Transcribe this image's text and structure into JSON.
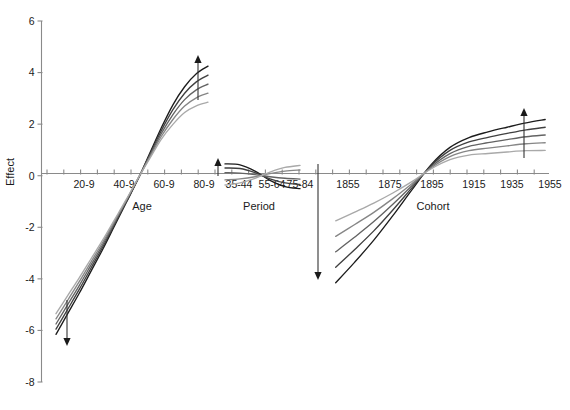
{
  "chart_data": {
    "type": "line",
    "title": "",
    "xlabel": "",
    "ylabel": "Effect",
    "ylim": [
      -8,
      6
    ],
    "grid": false,
    "legend": "none",
    "y_ticks": [
      "6",
      "4",
      "2",
      "0",
      "-2",
      "-4",
      "-6",
      "-8"
    ],
    "y_tick_values": [
      6,
      4,
      2,
      0,
      -2,
      -4,
      -6,
      -8
    ],
    "panels": [
      {
        "name": "Age",
        "label": "Age",
        "tick_labels": [
          "20-9",
          "40-9",
          "60-9",
          "80-9"
        ],
        "x": [
          20,
          25,
          30,
          35,
          40,
          45,
          50,
          55,
          60,
          65,
          70,
          75,
          80,
          85
        ],
        "series": [
          {
            "name": "curve-1",
            "color": "#1c1c1c",
            "values": [
              -6.15,
              -5.35,
              -4.55,
              -3.7,
              -2.85,
              -1.95,
              -1.05,
              -0.15,
              0.85,
              1.85,
              2.75,
              3.45,
              3.95,
              4.25
            ]
          },
          {
            "name": "curve-2",
            "color": "#404040",
            "values": [
              -5.95,
              -5.18,
              -4.4,
              -3.58,
              -2.76,
              -1.89,
              -1.02,
              -0.14,
              0.8,
              1.74,
              2.56,
              3.2,
              3.64,
              3.9
            ]
          },
          {
            "name": "curve-3",
            "color": "#636363",
            "values": [
              -5.75,
              -5.0,
              -4.25,
              -3.46,
              -2.67,
              -1.83,
              -0.99,
              -0.13,
              0.75,
              1.63,
              2.37,
              2.95,
              3.33,
              3.55
            ]
          },
          {
            "name": "curve-4",
            "color": "#868686",
            "values": [
              -5.55,
              -4.83,
              -4.1,
              -3.34,
              -2.58,
              -1.77,
              -0.96,
              -0.12,
              0.7,
              1.52,
              2.18,
              2.7,
              3.02,
              3.2
            ]
          },
          {
            "name": "curve-5",
            "color": "#a9a9a9",
            "values": [
              -5.35,
              -4.65,
              -3.95,
              -3.22,
              -2.49,
              -1.71,
              -0.93,
              -0.11,
              0.65,
              1.41,
              1.99,
              2.45,
              2.71,
              2.85
            ]
          }
        ],
        "arrows": [
          {
            "name": "age-arrow-down",
            "direction": "down",
            "x_px": 67,
            "y_top_px": 300,
            "y_bottom_px": 346
          },
          {
            "name": "age-arrow-up",
            "direction": "up",
            "x_px": 198,
            "y_top_px": 55,
            "y_bottom_px": 100
          }
        ]
      },
      {
        "name": "Period",
        "label": "Period",
        "tick_labels": [
          "35-44",
          "55-64",
          "75-84"
        ],
        "x": [
          35,
          45,
          55,
          65,
          75,
          85
        ],
        "series": [
          {
            "name": "curve-1",
            "color": "#1c1c1c",
            "values": [
              0.46,
              0.42,
              0.18,
              -0.18,
              -0.42,
              -0.5
            ]
          },
          {
            "name": "curve-2",
            "color": "#404040",
            "values": [
              0.3,
              0.28,
              0.12,
              -0.12,
              -0.28,
              -0.34
            ]
          },
          {
            "name": "curve-3",
            "color": "#636363",
            "values": [
              0.12,
              0.1,
              0.04,
              -0.04,
              -0.1,
              -0.13
            ]
          },
          {
            "name": "curve-4",
            "color": "#868686",
            "values": [
              -0.16,
              -0.12,
              -0.04,
              0.08,
              0.18,
              0.22
            ]
          },
          {
            "name": "curve-5",
            "color": "#a9a9a9",
            "values": [
              -0.36,
              -0.28,
              -0.1,
              0.14,
              0.32,
              0.4
            ]
          }
        ],
        "arrows": [
          {
            "name": "period-arrow-up",
            "direction": "up",
            "x_px": 218,
            "y_top_px": 158,
            "y_bottom_px": 176
          },
          {
            "name": "period-arrow-down",
            "direction": "down",
            "x_px": 318,
            "y_top_px": 164,
            "y_bottom_px": 280
          }
        ]
      },
      {
        "name": "Cohort",
        "label": "Cohort",
        "tick_labels": [
          "1855",
          "1875",
          "1895",
          "1915",
          "1935",
          "1955"
        ],
        "x": [
          1850,
          1860,
          1870,
          1880,
          1890,
          1900,
          1910,
          1920,
          1930,
          1940,
          1950,
          1960
        ],
        "series": [
          {
            "name": "curve-1",
            "color": "#1c1c1c",
            "values": [
              -4.15,
              -3.35,
              -2.5,
              -1.55,
              -0.55,
              0.42,
              1.1,
              1.48,
              1.7,
              1.88,
              2.05,
              2.18
            ]
          },
          {
            "name": "curve-2",
            "color": "#404040",
            "values": [
              -3.55,
              -2.86,
              -2.14,
              -1.33,
              -0.47,
              0.38,
              0.98,
              1.31,
              1.49,
              1.64,
              1.78,
              1.88
            ]
          },
          {
            "name": "curve-3",
            "color": "#636363",
            "values": [
              -2.95,
              -2.38,
              -1.78,
              -1.11,
              -0.39,
              0.34,
              0.86,
              1.14,
              1.28,
              1.4,
              1.51,
              1.58
            ]
          },
          {
            "name": "curve-4",
            "color": "#868686",
            "values": [
              -2.35,
              -1.89,
              -1.42,
              -0.89,
              -0.31,
              0.3,
              0.74,
              0.97,
              1.07,
              1.16,
              1.24,
              1.28
            ]
          },
          {
            "name": "curve-5",
            "color": "#a9a9a9",
            "values": [
              -1.75,
              -1.41,
              -1.06,
              -0.67,
              -0.23,
              0.26,
              0.62,
              0.8,
              0.86,
              0.92,
              0.97,
              0.98
            ]
          }
        ],
        "arrows": [
          {
            "name": "cohort-arrow-up",
            "direction": "up",
            "x_px": 524,
            "y_top_px": 108,
            "y_bottom_px": 158
          }
        ]
      }
    ],
    "axis_colors": {
      "axis": "#8a8a8a",
      "text": "#1a1a1a",
      "background": "#ffffff"
    }
  }
}
